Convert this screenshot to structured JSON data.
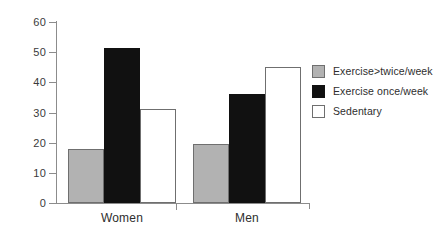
{
  "chart_data": {
    "type": "bar",
    "title": "",
    "subtitle": "",
    "xlabel": "",
    "ylabel": "",
    "categories": [
      "Women",
      "Men"
    ],
    "series": [
      {
        "name": "Exercise>twice/week",
        "values": [
          18,
          19.5
        ],
        "color": "#b2b2b2"
      },
      {
        "name": "Exercise once/week",
        "values": [
          51.5,
          36
        ],
        "color": "#111111"
      },
      {
        "name": "Sedentary",
        "values": [
          31,
          45
        ],
        "color": "#ffffff"
      }
    ],
    "ylim": [
      0,
      60
    ],
    "ytick_labels": [
      "0",
      "10",
      "20",
      "30",
      "40",
      "50",
      "60"
    ],
    "ytick_values": [
      0,
      10,
      20,
      30,
      40,
      50,
      60
    ],
    "grid": false,
    "legend_position": "right",
    "axis_color": "#8c8c8c",
    "bar_edge_color": "#6f6f6f"
  }
}
